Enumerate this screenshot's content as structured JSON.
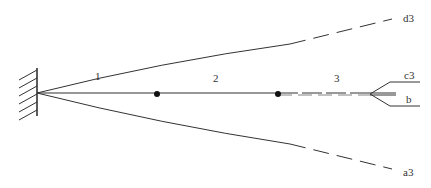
{
  "diagram": {
    "labels": {
      "segment_1": "1",
      "segment_2": "2",
      "segment_3": "3",
      "upper_bound": "d3",
      "lower_bound": "a3",
      "upper_branch": "c3",
      "lower_branch": "b"
    },
    "colors": {
      "line": "#333333",
      "background": "#ffffff"
    }
  }
}
